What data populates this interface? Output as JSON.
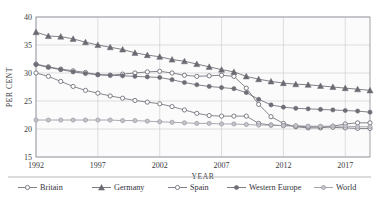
{
  "figure": {
    "title": "",
    "width": 379,
    "height": 199
  },
  "axes": {
    "ylabel": "PER CENT",
    "xlabel": "YEAR",
    "yticks": [
      "15",
      "20",
      "25",
      "30",
      "35",
      "40"
    ],
    "xticks": [
      "1992",
      "1997",
      "2002",
      "2007",
      "2012",
      "2017"
    ]
  },
  "legend": {
    "items": [
      {
        "label": "Britain",
        "marker": "open-circle",
        "color": "#6f6f78"
      },
      {
        "label": "Germany",
        "marker": "triangle",
        "color": "#6a6a72"
      },
      {
        "label": "Spain",
        "marker": "open-circle",
        "color": "#72727b"
      },
      {
        "label": "Western Europe",
        "marker": "filled-circle",
        "color": "#6e6e77"
      },
      {
        "label": "World",
        "marker": "light-circle",
        "color": "#9a9aa3"
      }
    ]
  },
  "chart_data": {
    "type": "line",
    "title": "",
    "xlabel": "YEAR",
    "ylabel": "PER CENT",
    "xlim": [
      1992,
      2019
    ],
    "ylim": [
      15,
      40
    ],
    "yticks": [
      15,
      20,
      25,
      30,
      35,
      40
    ],
    "xticks": [
      1992,
      1997,
      2002,
      2007,
      2012,
      2017
    ],
    "grid": true,
    "legend_position": "below",
    "x": [
      1992,
      1993,
      1994,
      1995,
      1996,
      1997,
      1998,
      1999,
      2000,
      2001,
      2002,
      2003,
      2004,
      2005,
      2006,
      2007,
      2008,
      2009,
      2010,
      2011,
      2012,
      2013,
      2014,
      2015,
      2016,
      2017,
      2018,
      2019
    ],
    "series": [
      {
        "name": "Britain",
        "marker": "open-circle",
        "color": "#6f6f78",
        "values": [
          31.6,
          31.1,
          30.7,
          30.4,
          30.1,
          29.7,
          29.6,
          29.8,
          30.0,
          30.2,
          30.3,
          30.0,
          29.6,
          29.4,
          29.5,
          29.6,
          29.4,
          27.3,
          24.4,
          22.2,
          21.0,
          20.4,
          20.2,
          20.2,
          20.5,
          20.9,
          21.1,
          21.1
        ]
      },
      {
        "name": "Germany",
        "marker": "triangle",
        "color": "#6a6a72",
        "values": [
          37.3,
          36.6,
          36.5,
          36.1,
          35.5,
          35.0,
          34.6,
          34.2,
          33.6,
          33.2,
          32.9,
          32.4,
          32.1,
          31.6,
          31.1,
          30.6,
          30.2,
          29.4,
          28.9,
          28.5,
          28.2,
          28.0,
          27.9,
          27.7,
          27.5,
          27.3,
          27.1,
          26.9
        ]
      },
      {
        "name": "Spain",
        "marker": "open-circle",
        "color": "#72727b",
        "values": [
          30.0,
          29.4,
          28.5,
          27.6,
          26.9,
          26.4,
          25.9,
          25.5,
          25.1,
          24.8,
          24.5,
          24.0,
          23.4,
          22.8,
          22.4,
          22.3,
          22.3,
          22.3,
          21.0,
          20.7,
          20.6,
          20.5,
          20.4,
          20.4,
          20.3,
          20.2,
          20.1,
          20.1
        ]
      },
      {
        "name": "Western Europe",
        "marker": "filled-circle",
        "color": "#6e6e77",
        "values": [
          31.5,
          31.0,
          30.6,
          30.2,
          29.9,
          29.7,
          29.6,
          29.5,
          29.4,
          29.3,
          29.2,
          28.8,
          28.3,
          27.9,
          27.6,
          27.4,
          27.2,
          26.5,
          25.3,
          24.3,
          23.9,
          23.7,
          23.6,
          23.5,
          23.4,
          23.3,
          23.2,
          23.0
        ]
      },
      {
        "name": "World",
        "marker": "light-circle",
        "color": "#9a9aa3",
        "values": [
          21.6,
          21.6,
          21.6,
          21.6,
          21.6,
          21.6,
          21.6,
          21.5,
          21.5,
          21.4,
          21.3,
          21.2,
          21.1,
          21.0,
          21.0,
          20.9,
          20.9,
          20.8,
          20.7,
          20.7,
          20.6,
          20.6,
          20.5,
          20.5,
          20.5,
          20.5,
          20.4,
          20.4
        ]
      }
    ]
  }
}
